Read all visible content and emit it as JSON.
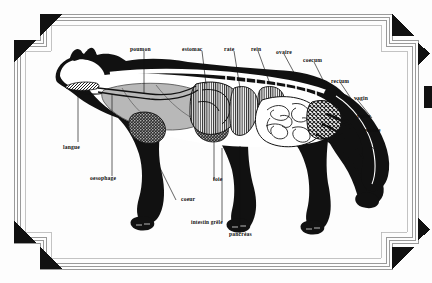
{
  "page": {
    "background_color": "#fdfdfd",
    "ink_color": "#0d0d0d",
    "caption": ""
  },
  "frame": {
    "style_name": "art-deco-stepped-border",
    "line_color": "#9a9a9a",
    "accent_color": "#111111",
    "corners": [
      "top-left",
      "top-right",
      "bottom-left",
      "bottom-right"
    ]
  },
  "figure": {
    "view": "left lateral cutaway",
    "silhouette_color": "#111111",
    "organ_fills": {
      "lung": "#b8b8b8",
      "stomach": "striped-vertical",
      "spleen": "striped-vertical",
      "kidney": "striped-vertical",
      "heart": "dark-stipple",
      "liver": "dark-stipple",
      "intestine": "#ffffff",
      "colon": "cross-hatch",
      "tongue": "cross-hatch",
      "skeleton": "#ffffff"
    }
  },
  "labels": [
    {
      "id": "poumon",
      "text": "poumon",
      "x": 130,
      "y": 47
    },
    {
      "id": "estomac",
      "text": "estomac",
      "x": 182,
      "y": 47
    },
    {
      "id": "rate",
      "text": "rate",
      "x": 222,
      "y": 47
    },
    {
      "id": "rein",
      "text": "rein",
      "x": 251,
      "y": 47
    },
    {
      "id": "ovaire",
      "text": "ovaire",
      "x": 276,
      "y": 50
    },
    {
      "id": "coecum",
      "text": "coecum",
      "x": 303,
      "y": 57
    },
    {
      "id": "rectum",
      "text": "rectum",
      "x": 330,
      "y": 78
    },
    {
      "id": "vagin",
      "text": "vagin",
      "x": 353,
      "y": 95
    },
    {
      "id": "vulve",
      "text": "vulve",
      "x": 356,
      "y": 113
    },
    {
      "id": "vessie",
      "text": "vessie",
      "x": 365,
      "y": 127
    },
    {
      "id": "langue",
      "text": "langue",
      "x": 63,
      "y": 144
    },
    {
      "id": "oesophage",
      "text": "oesophage",
      "x": 90,
      "y": 175
    },
    {
      "id": "foie",
      "text": "foie",
      "x": 212,
      "y": 176
    },
    {
      "id": "coeur",
      "text": "coeur",
      "x": 181,
      "y": 196
    },
    {
      "id": "intestin-grele",
      "text": "intestin grêle",
      "x": 191,
      "y": 219
    },
    {
      "id": "pancreas",
      "text": "pancréas",
      "x": 228,
      "y": 231
    }
  ]
}
